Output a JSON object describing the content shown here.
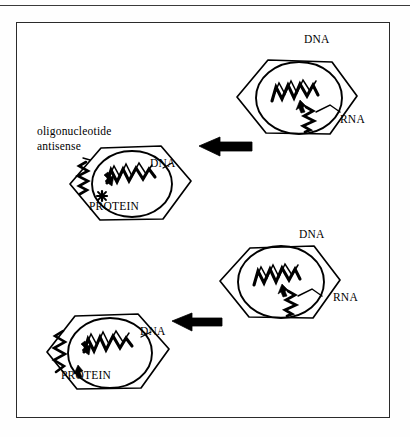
{
  "figure": {
    "background_color": "#ffffff",
    "ink_color": "#000000",
    "frame_color": "#2b2b2b",
    "top_rule_color": "#3a3a3a"
  },
  "labels": {
    "oligonucleotide_line1": "oligonucleotide",
    "oligonucleotide_line2": "antisense",
    "dna_top_right": "DNA",
    "rna_top_right": "RNA",
    "dna_top_left": "DNA",
    "protein_top_left": "PROTEIN",
    "dna_bottom_right": "DNA",
    "rna_bottom_right": "RNA",
    "dna_bottom_left": "DNA",
    "protein_bottom_left": "PROTEIN"
  },
  "panels": [
    {
      "id": "top-right-cell",
      "role": "source-cell-antisense-pathway",
      "shape": "hexagon",
      "nucleus": "circle",
      "contents": [
        "dna-zigzag",
        "transcription-arrow",
        "rna-zigzag"
      ],
      "labels": [
        "DNA",
        "RNA"
      ]
    },
    {
      "id": "top-left-cell",
      "role": "target-cell-blocked-translation",
      "shape": "hexagon",
      "nucleus": "circle",
      "contents": [
        "dna-zigzag",
        "transcription-arrow",
        "antisense-oligo-squiggle",
        "blocked-protein-star"
      ],
      "labels": [
        "DNA",
        "PROTEIN",
        "oligonucleotide antisense"
      ]
    },
    {
      "id": "bottom-right-cell",
      "role": "source-cell-normal-pathway",
      "shape": "hexagon",
      "nucleus": "circle",
      "contents": [
        "dna-zigzag",
        "transcription-arrow",
        "rna-zigzag"
      ],
      "labels": [
        "DNA",
        "RNA"
      ]
    },
    {
      "id": "bottom-left-cell",
      "role": "target-cell-normal-translation",
      "shape": "hexagon",
      "nucleus": "circle",
      "contents": [
        "dna-zigzag",
        "transcription-arrow",
        "protein-squiggle"
      ],
      "labels": [
        "DNA",
        "PROTEIN"
      ]
    }
  ],
  "arrows": [
    {
      "id": "arrow-top",
      "direction": "left",
      "from": "top-right-cell",
      "to": "top-left-cell",
      "style": "solid-block"
    },
    {
      "id": "arrow-bottom",
      "direction": "left",
      "from": "bottom-right-cell",
      "to": "bottom-left-cell",
      "style": "solid-block"
    }
  ]
}
